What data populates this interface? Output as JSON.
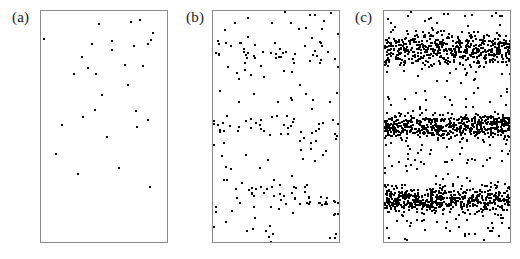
{
  "figure": {
    "background": "#ffffff",
    "dot_color": "#000000",
    "border_color": "#8a8a8a"
  },
  "panels": [
    {
      "id": "a",
      "label": "(a)"
    },
    {
      "id": "b",
      "label": "(b)"
    },
    {
      "id": "c",
      "label": "(c)"
    }
  ],
  "chart_data": {
    "type": "scatter",
    "title": "",
    "xlabel": "",
    "ylabel": "",
    "grid": false,
    "legend": null,
    "axis_ticks": false,
    "panel_geometry": {
      "box_width_px": 128,
      "box_height_px": 233,
      "dot_size_px": 2,
      "panel_left_px": [
        40,
        212,
        383
      ],
      "panel_top_px": 10
    },
    "xlim": [
      0,
      1
    ],
    "ylim": [
      0,
      1
    ],
    "bands": {
      "count": 3,
      "centers_norm": [
        0.165,
        0.495,
        0.808
      ],
      "half_width_norm": [
        0.105,
        0.075,
        0.085
      ],
      "note": "Band centers given as fraction of box height measured from the top edge."
    },
    "panel_series": [
      {
        "name": "(a)",
        "n_points": 30,
        "band_fraction": 0.0,
        "density_label": "sparse / uniform",
        "points": [
          [
            0.455,
            0.055
          ],
          [
            0.707,
            0.048
          ],
          [
            0.772,
            0.04
          ],
          [
            0.873,
            0.093
          ],
          [
            0.025,
            0.12
          ],
          [
            0.555,
            0.128
          ],
          [
            0.835,
            0.14
          ],
          [
            0.86,
            0.125
          ],
          [
            0.398,
            0.143
          ],
          [
            0.725,
            0.15
          ],
          [
            0.558,
            0.168
          ],
          [
            0.322,
            0.198
          ],
          [
            0.66,
            0.232
          ],
          [
            0.795,
            0.235
          ],
          [
            0.37,
            0.245
          ],
          [
            0.255,
            0.272
          ],
          [
            0.43,
            0.272
          ],
          [
            0.68,
            0.318
          ],
          [
            0.48,
            0.36
          ],
          [
            0.418,
            0.423
          ],
          [
            0.74,
            0.428
          ],
          [
            0.33,
            0.455
          ],
          [
            0.833,
            0.468
          ],
          [
            0.163,
            0.49
          ],
          [
            0.752,
            0.497
          ],
          [
            0.515,
            0.54
          ],
          [
            0.12,
            0.615
          ],
          [
            0.612,
            0.672
          ],
          [
            0.288,
            0.7
          ],
          [
            0.848,
            0.755
          ]
        ]
      },
      {
        "name": "(b)",
        "n_points": 215,
        "band_fraction": 0.55,
        "density_label": "moderate, banding emerging",
        "seed": 20814
      },
      {
        "name": "(c)",
        "n_points": 1850,
        "band_fraction": 0.88,
        "density_label": "dense, three sharp bands",
        "seed": 77109
      }
    ]
  }
}
